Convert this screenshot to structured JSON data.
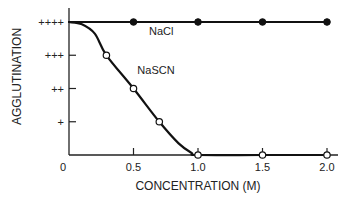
{
  "chart_data": {
    "type": "line",
    "title": "",
    "xlabel": "CONCENTRATION (M)",
    "ylabel": "AGGLUTINATION",
    "xlim": [
      0,
      2.0
    ],
    "ylim": [
      0,
      4
    ],
    "x_ticks": [
      {
        "value": 0,
        "label": "0"
      },
      {
        "value": 0.5,
        "label": "0.5"
      },
      {
        "value": 1.0,
        "label": "1.0"
      },
      {
        "value": 1.5,
        "label": "1.5"
      },
      {
        "value": 2.0,
        "label": "2.0"
      }
    ],
    "y_ticks": [
      {
        "value": 1,
        "label": "+"
      },
      {
        "value": 2,
        "label": "++"
      },
      {
        "value": 3,
        "label": "+++"
      },
      {
        "value": 4,
        "label": "++++"
      }
    ],
    "grid": false,
    "series": [
      {
        "name": "NaCl",
        "marker": "filled-circle",
        "curve": [
          [
            0,
            4
          ],
          [
            0.5,
            4
          ],
          [
            1.0,
            4
          ],
          [
            1.5,
            4
          ],
          [
            2.0,
            4
          ]
        ],
        "points": [
          [
            0.5,
            4
          ],
          [
            1.0,
            4
          ],
          [
            1.5,
            4
          ],
          [
            2.0,
            4
          ]
        ]
      },
      {
        "name": "NaSCN",
        "marker": "open-circle",
        "curve": [
          [
            0,
            4
          ],
          [
            0.1,
            3.93
          ],
          [
            0.2,
            3.65
          ],
          [
            0.29,
            3
          ],
          [
            0.5,
            2
          ],
          [
            0.7,
            1
          ],
          [
            0.85,
            0.35
          ],
          [
            0.95,
            0.06
          ],
          [
            1.0,
            0
          ],
          [
            1.5,
            0
          ],
          [
            2.0,
            0
          ]
        ],
        "points": [
          [
            0.29,
            3
          ],
          [
            0.5,
            2
          ],
          [
            0.7,
            1
          ],
          [
            1.0,
            0
          ],
          [
            1.5,
            0
          ],
          [
            2.0,
            0
          ]
        ]
      }
    ],
    "annotations": [
      {
        "text": "NaCl",
        "series": "NaCl",
        "x": 0.62,
        "y": 3.6
      },
      {
        "text": "NaSCN",
        "series": "NaSCN",
        "x": 0.53,
        "y": 2.45
      }
    ]
  }
}
